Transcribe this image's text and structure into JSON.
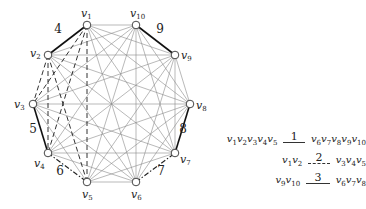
{
  "graph": {
    "vertices": [
      {
        "id": "v1",
        "label": "v",
        "sub": "1"
      },
      {
        "id": "v2",
        "label": "v",
        "sub": "2"
      },
      {
        "id": "v3",
        "label": "v",
        "sub": "3"
      },
      {
        "id": "v4",
        "label": "v",
        "sub": "4"
      },
      {
        "id": "v5",
        "label": "v",
        "sub": "5"
      },
      {
        "id": "v6",
        "label": "v",
        "sub": "6"
      },
      {
        "id": "v7",
        "label": "v",
        "sub": "7"
      },
      {
        "id": "v8",
        "label": "v",
        "sub": "8"
      },
      {
        "id": "v9",
        "label": "v",
        "sub": "9"
      },
      {
        "id": "v10",
        "label": "v",
        "sub": "10"
      }
    ],
    "complete_graph": "K10",
    "highlighted_edges": [
      {
        "from": "v1",
        "to": "v2",
        "style": "bold",
        "label": "4"
      },
      {
        "from": "v10",
        "to": "v9",
        "style": "bold",
        "label": "9"
      },
      {
        "from": "v3",
        "to": "v4",
        "style": "bold",
        "label": "5"
      },
      {
        "from": "v8",
        "to": "v7",
        "style": "bold",
        "label": "8"
      },
      {
        "from": "v4",
        "to": "v5",
        "style": "dashdot",
        "label": "6"
      },
      {
        "from": "v6",
        "to": "v7",
        "style": "dashdot",
        "label": "7"
      }
    ],
    "dashed_group": {
      "left": [
        "v1",
        "v2"
      ],
      "right": [
        "v3",
        "v4",
        "v5"
      ]
    }
  },
  "legend": [
    {
      "left": [
        "1",
        "2",
        "3",
        "4",
        "5"
      ],
      "number": "1",
      "style": "solid",
      "right": [
        "6",
        "7",
        "8",
        "9",
        "10"
      ]
    },
    {
      "left": [
        "1",
        "2"
      ],
      "number": "2",
      "style": "dashed",
      "right": [
        "3",
        "4",
        "5"
      ]
    },
    {
      "left": [
        "9",
        "10"
      ],
      "number": "3",
      "style": "solid",
      "right": [
        "6",
        "7",
        "8"
      ]
    }
  ]
}
